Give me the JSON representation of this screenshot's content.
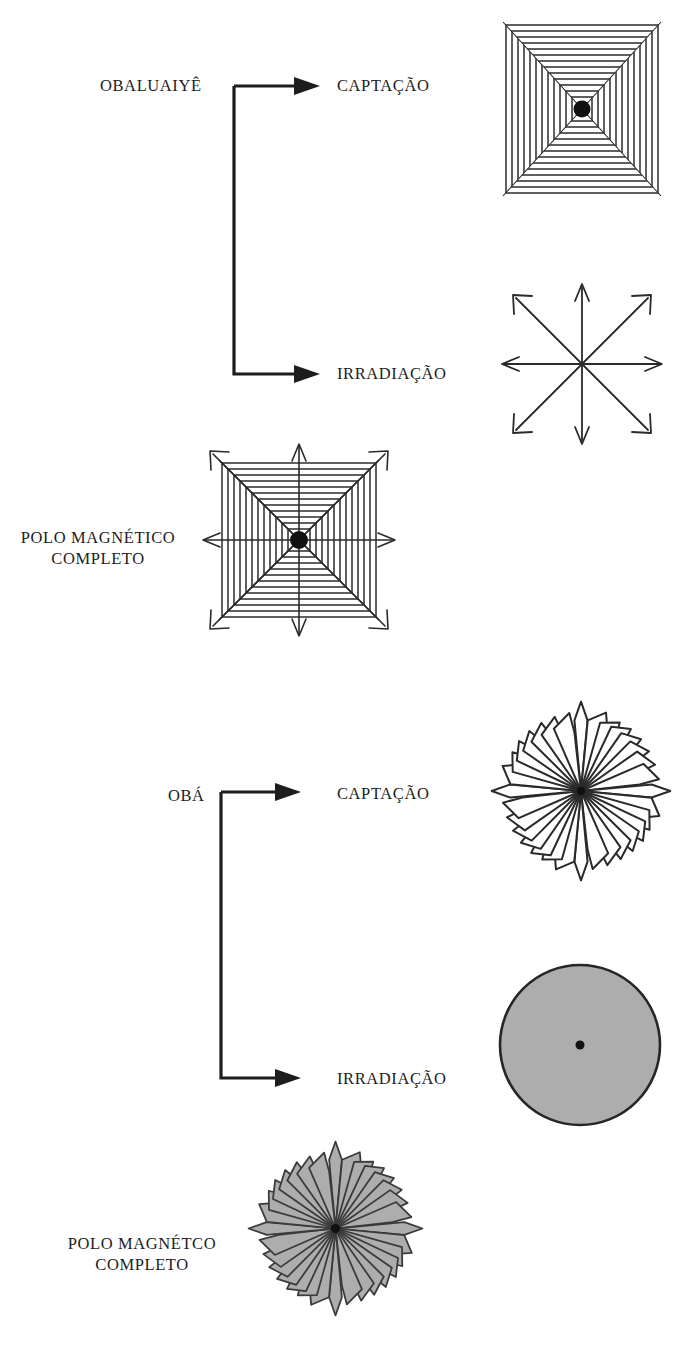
{
  "page": {
    "background_color": "#ffffff",
    "ink_color": "#1d1d1d",
    "fill_gray": "#adadad",
    "width": 694,
    "height": 1348
  },
  "sections": [
    {
      "id": "obaluaiye",
      "entity_label": "OBALUAIYÊ",
      "branches": [
        {
          "id": "captacao",
          "label": "CAPTAÇÃO",
          "figure": "striped-square"
        },
        {
          "id": "irradiacao",
          "label": "IRRADIAÇÃO",
          "figure": "eight-arrow-star"
        }
      ],
      "summary_label_lines": [
        "POLO MAGNÉTICO",
        "COMPLETO"
      ],
      "summary_figure": "striped-square-with-arrows"
    },
    {
      "id": "oba",
      "entity_label": "OBÁ",
      "branches": [
        {
          "id": "captacao",
          "label": "CAPTAÇÃO",
          "figure": "sixteen-petal-rosette-outline"
        },
        {
          "id": "irradiacao",
          "label": "IRRADIAÇÃO",
          "figure": "filled-circle-with-center-dot"
        }
      ],
      "summary_label_lines": [
        "POLO MAGNÉTCO",
        "COMPLETO"
      ],
      "summary_figure": "sixteen-petal-rosette-filled"
    }
  ],
  "figures": {
    "striped-square": {
      "name": "striped-square",
      "stripe_count": 15,
      "has_center_dot": true,
      "fill": "#ffffff"
    },
    "eight-arrow-star": {
      "name": "eight-arrow-star",
      "arrow_count": 8,
      "has_center_dot": false
    },
    "striped-square-with-arrows": {
      "name": "striped-square-with-arrows",
      "stripe_count": 15,
      "arrow_count": 8,
      "has_center_dot": true
    },
    "sixteen-petal-rosette-outline": {
      "name": "sixteen-petal-rosette-outline",
      "petal_count": 16,
      "fill": "#ffffff",
      "has_center_dot": true
    },
    "filled-circle-with-center-dot": {
      "name": "filled-circle-with-center-dot",
      "fill": "#adadad",
      "has_center_dot": true
    },
    "sixteen-petal-rosette-filled": {
      "name": "sixteen-petal-rosette-filled",
      "petal_count": 16,
      "fill": "#adadad",
      "has_center_dot": true
    }
  },
  "labels": {
    "obaluaiye_entity": "OBALUAIYÊ",
    "obaluaiye_captacao": "CAPTAÇÃO",
    "obaluaiye_irradiacao": "IRRADIAÇÃO",
    "obaluaiye_polo_line1": "POLO MAGNÉTICO",
    "obaluaiye_polo_line2": "COMPLETO",
    "oba_entity": "OBÁ",
    "oba_captacao": "CAPTAÇÃO",
    "oba_irradiacao": "IRRADIAÇÃO",
    "oba_polo_line1": "POLO MAGNÉTCO",
    "oba_polo_line2": "COMPLETO"
  }
}
